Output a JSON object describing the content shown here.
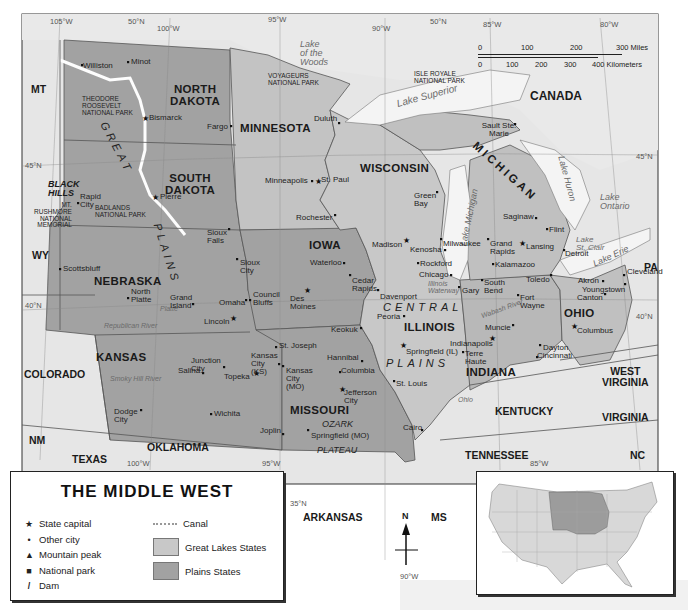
{
  "title": "THE MIDDLE WEST",
  "colors": {
    "background_map": "#e6e6e6",
    "great_lakes_states": "#c8c8c8",
    "plains_states": "#a2a2a2",
    "water": "#f4f4f4",
    "border": "#555555"
  },
  "graticule": {
    "top": [
      "105°W",
      "50°N",
      "100°W",
      "95°W",
      "90°W",
      "50°N",
      "85°W",
      "80°W"
    ],
    "left": [
      "45°N",
      "40°N"
    ],
    "right": [
      "45°N",
      "40°N"
    ],
    "bottom": [
      "100°W",
      "95°W",
      "35°N",
      "90°W",
      "85°W"
    ]
  },
  "scale_bar": {
    "miles": [
      "0",
      "100",
      "200",
      "300 Miles"
    ],
    "kilometers": [
      "0",
      "100",
      "200",
      "300",
      "400 Kilometers"
    ]
  },
  "states": {
    "plains": [
      "NORTH DAKOTA",
      "SOUTH DAKOTA",
      "NEBRASKA",
      "KANSAS",
      "MINNESOTA",
      "IOWA",
      "MISSOURI"
    ],
    "great_lakes": [
      "WISCONSIN",
      "MICHIGAN",
      "ILLINOIS",
      "INDIANA",
      "OHIO"
    ],
    "neighbors": [
      "MT",
      "WY",
      "COLORADO",
      "NM",
      "TEXAS",
      "OKLAHOMA",
      "ARKANSAS",
      "MS",
      "TENNESSEE",
      "KENTUCKY",
      "WEST VIRGINIA",
      "VIRGINIA",
      "NC",
      "PA",
      "CANADA"
    ]
  },
  "labels": {
    "north_dakota": "NORTH\nDAKOTA",
    "south_dakota": "SOUTH\nDAKOTA",
    "nebraska": "NEBRASKA",
    "kansas": "KANSAS",
    "minnesota": "MINNESOTA",
    "iowa": "IOWA",
    "missouri": "MISSOURI",
    "wisconsin": "WISCONSIN",
    "michigan": "MICHIGAN",
    "illinois": "ILLINOIS",
    "indiana": "INDIANA",
    "ohio": "OHIO",
    "mt": "MT",
    "wy": "WY",
    "colorado": "COLORADO",
    "nm": "NM",
    "texas": "TEXAS",
    "oklahoma": "OKLAHOMA",
    "arkansas": "ARKANSAS",
    "ms": "MS",
    "tennessee": "TENNESSEE",
    "kentucky": "KENTUCKY",
    "west_virginia": "WEST\nVIRGINIA",
    "virginia": "VIRGINIA",
    "nc": "NC",
    "pa": "PA",
    "canada": "CANADA"
  },
  "regions": {
    "great_plains_1": "GREAT",
    "great_plains_2": "PLAINS",
    "central_plains_1": "CENTRAL",
    "central_plains_2": "PLAINS",
    "black_hills": "BLACK\nHILLS",
    "ozark_1": "OZARK",
    "ozark_2": "PLATEAU"
  },
  "water": {
    "lake_woods": "Lake\nof the\nWoods",
    "lake_superior": "Lake  Superior",
    "lake_michigan": "Lake Michigan",
    "lake_huron": "Lake Huron",
    "lake_ontario": "Lake\nOntario",
    "lake_erie": "Lake Erie",
    "lake_st_clair": "Lake\nSt. Clair",
    "illinois_waterway": "Illinois\nWaterway",
    "wabash": "Wabash River",
    "ohio_river": "Ohio",
    "missouri_river": "Missouri",
    "republican": "Republican River",
    "smoky_hill": "Smoky Hill River",
    "platte": "Platte",
    "red_river": "Red River",
    "cheyenne": "Cheyenne"
  },
  "parks": {
    "theodore_roosevelt": "THEODORE\nROOSEVELT\nNATIONAL PARK",
    "voyageurs": "VOYAGEURS\nNATIONAL PARK",
    "isle_royale": "ISLE ROYALE\nNATIONAL PARK",
    "badlands": "BADLANDS\nNATIONAL PARK",
    "rushmore": "MT.\nRUSHMORE\nNATIONAL\nMEMORIAL"
  },
  "cities": [
    {
      "name": "Williston",
      "type": "city",
      "x": 82,
      "y": 65
    },
    {
      "name": "Minot",
      "type": "city",
      "x": 128,
      "y": 62
    },
    {
      "name": "Bismarck",
      "type": "capital",
      "x": 145,
      "y": 118
    },
    {
      "name": "Fargo",
      "type": "city",
      "x": 231,
      "y": 126
    },
    {
      "name": "Pierre",
      "type": "capital",
      "x": 155,
      "y": 197
    },
    {
      "name": "Rapid City",
      "type": "city",
      "x": 78,
      "y": 203
    },
    {
      "name": "Sioux Falls",
      "type": "city",
      "x": 229,
      "y": 229
    },
    {
      "name": "Sioux City",
      "type": "city",
      "x": 237,
      "y": 259
    },
    {
      "name": "Duluth",
      "type": "city",
      "x": 339,
      "y": 123
    },
    {
      "name": "Minneapolis",
      "type": "city",
      "x": 312,
      "y": 181
    },
    {
      "name": "St. Paul",
      "type": "capital",
      "x": 318,
      "y": 181
    },
    {
      "name": "Rochester",
      "type": "city",
      "x": 335,
      "y": 215
    },
    {
      "name": "Scottsbluff",
      "type": "city",
      "x": 60,
      "y": 269
    },
    {
      "name": "North Platte",
      "type": "city",
      "x": 128,
      "y": 298
    },
    {
      "name": "Grand Island",
      "type": "city",
      "x": 193,
      "y": 304
    },
    {
      "name": "Omaha",
      "type": "city",
      "x": 246,
      "y": 300
    },
    {
      "name": "Council Bluffs",
      "type": "city",
      "x": 250,
      "y": 300
    },
    {
      "name": "Lincoln",
      "type": "capital",
      "x": 233,
      "y": 318
    },
    {
      "name": "Des Moines",
      "type": "capital",
      "x": 307,
      "y": 290
    },
    {
      "name": "Waterloo",
      "type": "city",
      "x": 344,
      "y": 263
    },
    {
      "name": "Cedar Rapids",
      "type": "city",
      "x": 350,
      "y": 275
    },
    {
      "name": "Davenport",
      "type": "city",
      "x": 378,
      "y": 290
    },
    {
      "name": "Keokuk",
      "type": "city",
      "x": 361,
      "y": 328
    },
    {
      "name": "Green Bay",
      "type": "city",
      "x": 437,
      "y": 192
    },
    {
      "name": "Madison",
      "type": "capital",
      "x": 406,
      "y": 240
    },
    {
      "name": "Milwaukee",
      "type": "city",
      "x": 441,
      "y": 239
    },
    {
      "name": "Kenosha",
      "type": "city",
      "x": 445,
      "y": 250
    },
    {
      "name": "Rockford",
      "type": "city",
      "x": 418,
      "y": 263
    },
    {
      "name": "Chicago",
      "type": "city",
      "x": 451,
      "y": 275
    },
    {
      "name": "Peoria",
      "type": "city",
      "x": 404,
      "y": 316
    },
    {
      "name": "Springfield (IL)",
      "type": "capital",
      "x": 403,
      "y": 345
    },
    {
      "name": "St. Louis",
      "type": "city",
      "x": 394,
      "y": 381
    },
    {
      "name": "Hannibal",
      "type": "city",
      "x": 362,
      "y": 361
    },
    {
      "name": "St. Joseph",
      "type": "city",
      "x": 276,
      "y": 347
    },
    {
      "name": "Kansas City (KS)",
      "type": "city",
      "x": 279,
      "y": 364
    },
    {
      "name": "Kansas City (MO)",
      "type": "city",
      "x": 283,
      "y": 366
    },
    {
      "name": "Columbia",
      "type": "city",
      "x": 340,
      "y": 372
    },
    {
      "name": "Jefferson City",
      "type": "capital",
      "x": 342,
      "y": 389
    },
    {
      "name": "Joplin",
      "type": "city",
      "x": 283,
      "y": 434
    },
    {
      "name": "Springfield (MO)",
      "type": "city",
      "x": 308,
      "y": 430
    },
    {
      "name": "Cairo",
      "type": "city",
      "x": 422,
      "y": 430
    },
    {
      "name": "Junction City",
      "type": "city",
      "x": 224,
      "y": 367
    },
    {
      "name": "Salina",
      "type": "city",
      "x": 203,
      "y": 373
    },
    {
      "name": "Topeka",
      "type": "capital",
      "x": 256,
      "y": 373
    },
    {
      "name": "Dodge City",
      "type": "city",
      "x": 141,
      "y": 410
    },
    {
      "name": "Wichita",
      "type": "city",
      "x": 211,
      "y": 414
    },
    {
      "name": "Sault Ste. Marie",
      "type": "city",
      "x": 515,
      "y": 124
    },
    {
      "name": "Saginaw",
      "type": "city",
      "x": 536,
      "y": 218
    },
    {
      "name": "Flint",
      "type": "city",
      "x": 547,
      "y": 229
    },
    {
      "name": "Grand Rapids",
      "type": "city",
      "x": 488,
      "y": 239
    },
    {
      "name": "Lansing",
      "type": "capital",
      "x": 522,
      "y": 243
    },
    {
      "name": "Detroit",
      "type": "city",
      "x": 564,
      "y": 250
    },
    {
      "name": "Kalamazoo",
      "type": "city",
      "x": 493,
      "y": 264
    },
    {
      "name": "Toledo",
      "type": "city",
      "x": 551,
      "y": 275
    },
    {
      "name": "South Bend",
      "type": "city",
      "x": 482,
      "y": 280
    },
    {
      "name": "Gary",
      "type": "city",
      "x": 459,
      "y": 287
    },
    {
      "name": "Fort Wayne",
      "type": "city",
      "x": 518,
      "y": 295
    },
    {
      "name": "Cleveland",
      "type": "city",
      "x": 624,
      "y": 275
    },
    {
      "name": "Akron",
      "type": "city",
      "x": 603,
      "y": 281
    },
    {
      "name": "Youngstown",
      "type": "city",
      "x": 625,
      "y": 284
    },
    {
      "name": "Canton",
      "type": "city",
      "x": 605,
      "y": 294
    },
    {
      "name": "Columbus",
      "type": "capital",
      "x": 574,
      "y": 326
    },
    {
      "name": "Muncie",
      "type": "city",
      "x": 513,
      "y": 325
    },
    {
      "name": "Indianapolis",
      "type": "capital",
      "x": 492,
      "y": 338
    },
    {
      "name": "Terre Haute",
      "type": "city",
      "x": 463,
      "y": 352
    },
    {
      "name": "Dayton",
      "type": "city",
      "x": 540,
      "y": 345
    },
    {
      "name": "Cincinnati",
      "type": "city",
      "x": 537,
      "y": 357
    }
  ],
  "legend": {
    "items": [
      {
        "symbol": "★",
        "label": "State capital"
      },
      {
        "symbol": "•",
        "label": "Other city"
      },
      {
        "symbol": "▲",
        "label": "Mountain peak"
      },
      {
        "symbol": "■",
        "label": "National park"
      },
      {
        "symbol": "/",
        "label": "Dam"
      }
    ],
    "canal_label": "Canal",
    "great_lakes_label": "Great Lakes States",
    "plains_label": "Plains States"
  },
  "compass": {
    "label": "N"
  }
}
